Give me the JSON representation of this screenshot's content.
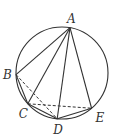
{
  "figure": {
    "type": "geometry",
    "stroke_color": "#333333",
    "background": "#ffffff"
  },
  "circle": {
    "cx": 62,
    "cy": 73,
    "r": 46
  },
  "points": {
    "A": {
      "label": "A",
      "angle_deg": -80,
      "label_dx": -3,
      "label_dy": -5
    },
    "B": {
      "label": "B",
      "angle_deg": 178,
      "label_dx": -13,
      "label_dy": 4
    },
    "C": {
      "label": "C",
      "angle_deg": 138,
      "label_dx": -9,
      "label_dy": 14
    },
    "D": {
      "label": "D",
      "angle_deg": 96,
      "label_dx": -4,
      "label_dy": 15
    },
    "E": {
      "label": "E",
      "angle_deg": 50,
      "label_dx": 4,
      "label_dy": 14
    }
  },
  "solid_segments": [
    [
      "A",
      "B"
    ],
    [
      "A",
      "C"
    ],
    [
      "A",
      "D"
    ],
    [
      "A",
      "E"
    ],
    [
      "B",
      "C"
    ],
    [
      "C",
      "D"
    ],
    [
      "D",
      "E"
    ]
  ],
  "dashed_segments": [
    [
      "B",
      "D"
    ],
    [
      "C",
      "E"
    ]
  ]
}
